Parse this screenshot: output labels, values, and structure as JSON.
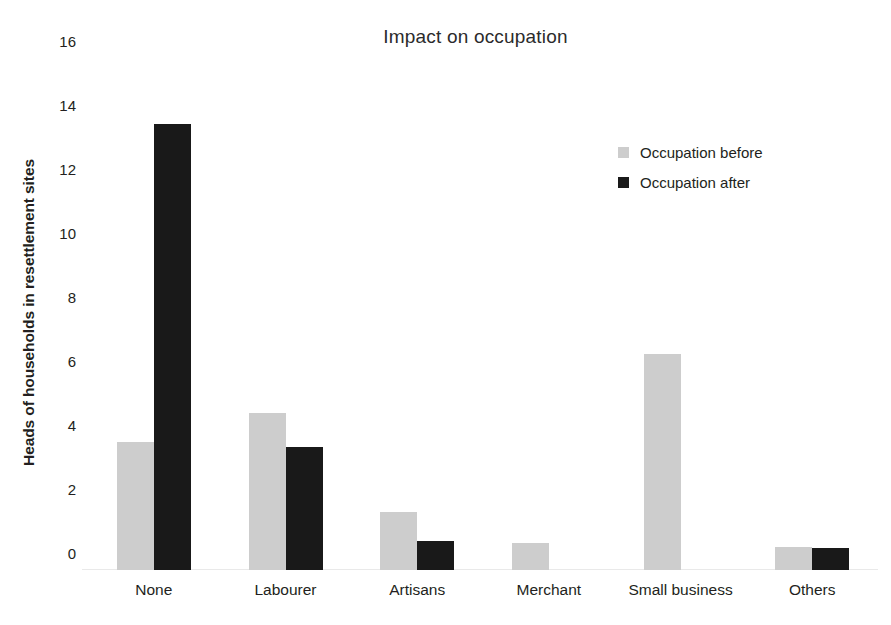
{
  "chart_data": {
    "type": "bar",
    "title": "Impact on occupation",
    "xlabel": "",
    "ylabel": "Heads of households in resettlement sites",
    "categories": [
      "None",
      "Labourer",
      "Artisans",
      "Merchant",
      "Small business",
      "Others"
    ],
    "series": [
      {
        "name": "Occupation before",
        "color": "#cdcdcd",
        "values": [
          4,
          4.9,
          1.8,
          0.85,
          6.75,
          0.72
        ]
      },
      {
        "name": "Occupation after",
        "color": "#191919",
        "values": [
          13.95,
          3.85,
          0.9,
          0,
          0,
          0.68
        ]
      }
    ],
    "ylim": [
      0,
      16
    ],
    "yticks": [
      16,
      14,
      12,
      10,
      8,
      6,
      4,
      2,
      0
    ],
    "grid": false,
    "legend_position": "right"
  }
}
